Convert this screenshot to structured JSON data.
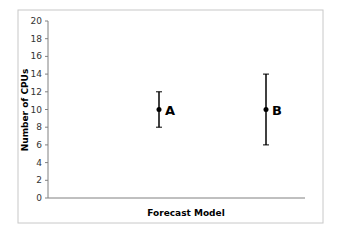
{
  "chart_data": {
    "type": "scatter",
    "title": "",
    "xlabel": "Forecast Model",
    "ylabel": "Number of CPUs",
    "ylim": [
      0,
      20
    ],
    "yticks": [
      0,
      2,
      4,
      6,
      8,
      10,
      12,
      14,
      16,
      18,
      20
    ],
    "grid": false,
    "legend": null,
    "points": [
      {
        "label": "A",
        "x": 1,
        "y": 10,
        "error_low": 8,
        "error_high": 12
      },
      {
        "label": "B",
        "x": 2,
        "y": 10,
        "error_low": 6,
        "error_high": 14
      }
    ]
  },
  "colors": {
    "frame": "#c8c8c8",
    "axis": "#808080",
    "series": "#000000"
  }
}
